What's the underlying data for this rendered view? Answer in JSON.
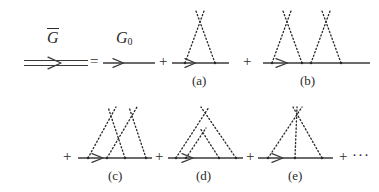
{
  "figure": {
    "name": "dyson-series-averaged-green-function",
    "line_color": "#3a3a3a",
    "dot_color": "#2b2b2b",
    "background": "#ffffff"
  },
  "labels": {
    "g_bar": "G",
    "g_bar_accent": "overbar",
    "g_zero": "G",
    "g_zero_sub": "0",
    "equals": "=",
    "plus": "+",
    "ellipsis": "···"
  },
  "terms": [
    {
      "id": "a",
      "tag": "(a)",
      "kind": "single-scatterer-one-vertex-pair",
      "crosses": 1,
      "vertices": 2
    },
    {
      "id": "b",
      "tag": "(b)",
      "kind": "two-independent-scatterers",
      "crosses": 2,
      "vertices": 4
    },
    {
      "id": "c",
      "tag": "(c)",
      "kind": "two-crossed-scatterers",
      "crosses": 2,
      "vertices": 4
    },
    {
      "id": "d",
      "tag": "(d)",
      "kind": "two-nested-scatterers",
      "crosses": 2,
      "vertices": 4
    },
    {
      "id": "e",
      "tag": "(e)",
      "kind": "single-scatterer-three-legs",
      "crosses": 1,
      "vertices": 3
    }
  ],
  "rows": [
    {
      "row": 1,
      "items": [
        "g_bar_propagator",
        "equals",
        "g_zero_propagator",
        "plus",
        "a",
        "plus",
        "b"
      ]
    },
    {
      "row": 2,
      "items": [
        "plus",
        "c",
        "plus",
        "d",
        "plus",
        "e",
        "plus",
        "ellipsis"
      ]
    }
  ]
}
